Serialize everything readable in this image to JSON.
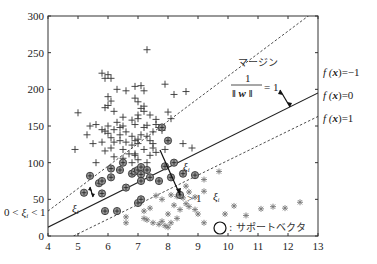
{
  "chart_data": {
    "type": "scatter",
    "title": "",
    "xlabel": "",
    "ylabel": "",
    "xlim": [
      4,
      13
    ],
    "ylim": [
      0,
      300
    ],
    "x_ticks": [
      4,
      5,
      6,
      7,
      8,
      9,
      10,
      11,
      12,
      13
    ],
    "y_ticks": [
      0,
      50,
      100,
      150,
      200,
      250,
      300
    ],
    "grid": false,
    "lines": [
      {
        "name": "f(x) = -1",
        "style": "dashed",
        "x": [
          4,
          13
        ],
        "y": [
          34,
          310
        ]
      },
      {
        "name": "f(x) = 0",
        "style": "solid",
        "x": [
          4,
          13
        ],
        "y": [
          12,
          195
        ]
      },
      {
        "name": "f(x) = 1",
        "style": "dashed",
        "x": [
          4.85,
          13
        ],
        "y": [
          0,
          163
        ]
      }
    ],
    "series": [
      {
        "name": "class +1 (plus markers)",
        "marker": "plus",
        "points": [
          [
            5.0,
            168
          ],
          [
            5.8,
            222
          ],
          [
            6.0,
            220
          ],
          [
            6.1,
            215
          ],
          [
            5.9,
            215
          ],
          [
            7.3,
            254
          ],
          [
            6.3,
            200
          ],
          [
            6.6,
            198
          ],
          [
            6.9,
            204
          ],
          [
            7.1,
            205
          ],
          [
            7.2,
            198
          ],
          [
            7.9,
            207
          ],
          [
            8.2,
            193
          ],
          [
            8.6,
            197
          ],
          [
            6.0,
            190
          ],
          [
            6.1,
            184
          ],
          [
            6.0,
            178
          ],
          [
            6.2,
            170
          ],
          [
            5.9,
            175
          ],
          [
            6.9,
            188
          ],
          [
            7.0,
            183
          ],
          [
            7.2,
            177
          ],
          [
            7.1,
            174
          ],
          [
            7.2,
            170
          ],
          [
            7.4,
            165
          ],
          [
            7.6,
            159
          ],
          [
            7.0,
            160
          ],
          [
            7.0,
            165
          ],
          [
            8.0,
            169
          ],
          [
            8.1,
            160
          ],
          [
            6.5,
            162
          ],
          [
            6.8,
            158
          ],
          [
            6.9,
            152
          ],
          [
            6.5,
            150
          ],
          [
            7.3,
            151
          ],
          [
            7.6,
            152
          ],
          [
            7.7,
            148
          ],
          [
            7.8,
            144
          ],
          [
            7.5,
            142
          ],
          [
            7.2,
            148
          ],
          [
            5.4,
            150
          ],
          [
            5.6,
            152
          ],
          [
            5.8,
            145
          ],
          [
            6.0,
            150
          ],
          [
            6.0,
            140
          ],
          [
            5.9,
            143
          ],
          [
            6.3,
            155
          ],
          [
            6.4,
            148
          ],
          [
            6.2,
            145
          ],
          [
            6.4,
            138
          ],
          [
            6.6,
            142
          ],
          [
            6.8,
            136
          ],
          [
            6.9,
            130
          ],
          [
            7.0,
            132
          ],
          [
            7.1,
            138
          ],
          [
            7.3,
            136
          ],
          [
            7.4,
            130
          ],
          [
            7.5,
            126
          ],
          [
            7.0,
            126
          ],
          [
            6.8,
            124
          ],
          [
            6.6,
            128
          ],
          [
            6.4,
            130
          ],
          [
            6.2,
            128
          ],
          [
            6.1,
            134
          ],
          [
            5.8,
            128
          ],
          [
            5.5,
            126
          ],
          [
            5.3,
            138
          ],
          [
            4.9,
            118
          ],
          [
            5.9,
            116
          ],
          [
            6.1,
            120
          ],
          [
            6.5,
            118
          ],
          [
            6.7,
            112
          ],
          [
            6.9,
            110
          ],
          [
            7.2,
            118
          ],
          [
            7.5,
            120
          ],
          [
            7.6,
            114
          ],
          [
            7.9,
            118
          ],
          [
            8.5,
            126
          ],
          [
            8.8,
            120
          ],
          [
            5.6,
            100
          ],
          [
            6.2,
            108
          ],
          [
            6.5,
            106
          ],
          [
            7.0,
            104
          ],
          [
            7.3,
            100
          ],
          [
            7.4,
            110
          ],
          [
            6.8,
            100
          ],
          [
            6.9,
            112
          ]
        ]
      },
      {
        "name": "class -1 (asterisk markers)",
        "marker": "asterisk",
        "points": [
          [
            9.7,
            88
          ],
          [
            9.2,
            77
          ],
          [
            9.2,
            61
          ],
          [
            10.2,
            41
          ],
          [
            10.6,
            28
          ],
          [
            11.1,
            37
          ],
          [
            11.5,
            40
          ],
          [
            11.9,
            38
          ],
          [
            12.4,
            46
          ],
          [
            9.9,
            30
          ],
          [
            9.2,
            18
          ],
          [
            8.6,
            68
          ],
          [
            8.7,
            60
          ],
          [
            8.3,
            54
          ],
          [
            8.5,
            52
          ],
          [
            8.9,
            53
          ],
          [
            8.1,
            56
          ],
          [
            7.8,
            50
          ],
          [
            7.6,
            55
          ],
          [
            7.1,
            46
          ],
          [
            7.4,
            38
          ],
          [
            7.2,
            34
          ],
          [
            7.3,
            22
          ],
          [
            7.5,
            18
          ],
          [
            7.7,
            16
          ],
          [
            7.9,
            14
          ],
          [
            8.0,
            12
          ],
          [
            7.8,
            20
          ],
          [
            7.2,
            24
          ],
          [
            6.6,
            26
          ],
          [
            6.6,
            18
          ],
          [
            8.0,
            30
          ],
          [
            8.3,
            24
          ],
          [
            8.1,
            18
          ],
          [
            8.4,
            36
          ],
          [
            8.2,
            42
          ],
          [
            8.6,
            44
          ],
          [
            8.7,
            40
          ],
          [
            8.9,
            36
          ],
          [
            9.0,
            30
          ]
        ]
      },
      {
        "name": "support vectors (circled)",
        "marker": "circle",
        "points": [
          [
            5.2,
            59
          ],
          [
            5.7,
            72
          ],
          [
            5.8,
            58
          ],
          [
            5.4,
            82
          ],
          [
            5.8,
            75
          ],
          [
            6.1,
            80
          ],
          [
            6.1,
            92
          ],
          [
            6.4,
            90
          ],
          [
            6.5,
            100
          ],
          [
            6.6,
            66
          ],
          [
            6.8,
            85
          ],
          [
            6.9,
            88
          ],
          [
            7.0,
            90
          ],
          [
            7.1,
            94
          ],
          [
            7.1,
            84
          ],
          [
            7.1,
            75
          ],
          [
            7.3,
            90
          ],
          [
            7.4,
            80
          ],
          [
            7.7,
            75
          ],
          [
            7.9,
            95
          ],
          [
            8.2,
            100
          ],
          [
            8.1,
            80
          ],
          [
            7.8,
            148
          ],
          [
            8.0,
            130
          ],
          [
            8.5,
            85
          ],
          [
            8.4,
            56
          ],
          [
            5.9,
            34
          ],
          [
            6.3,
            34
          ],
          [
            7.0,
            45
          ],
          [
            7.1,
            50
          ],
          [
            8.9,
            83
          ]
        ]
      }
    ],
    "annotations": [
      {
        "text": "マージン",
        "x": 11.0,
        "y": 205
      },
      {
        "text": "1 / ||w|| = 1",
        "x": 11.0,
        "y": 175
      },
      {
        "text": "f(x) = -1",
        "position": "right",
        "y": 175
      },
      {
        "text": "f(x) = 0",
        "position": "right",
        "y": 147
      },
      {
        "text": "f(x) = 1",
        "position": "right",
        "y": 113
      },
      {
        "text": "ξ_i",
        "x": 8.5,
        "y": 95
      },
      {
        "text": "ξ_i",
        "x": 5.0,
        "y": 40
      },
      {
        "text": "0 < ξ_i < 1",
        "position": "left",
        "y": 45
      },
      {
        "text": "ξ_i",
        "x": 9.0,
        "y": 48
      },
      {
        "text": "ξ_i > 1 arrow",
        "x": 8.8,
        "y": 60
      },
      {
        "text": "○ : サポートベクタ",
        "x": 9.7,
        "y": 15
      }
    ]
  },
  "labels": {
    "margin": "マージン",
    "frac_num": "1",
    "frac_den": "‖ w ‖",
    "frac_eq": "= 1",
    "f_minus1_pre": "f (",
    "f_var": "x",
    "f_minus1_post": ")=−1",
    "f_zero_post": ")=0",
    "f_one_post": ")=1",
    "xi": "ξ",
    "sub_i": "i",
    "zero_lt": "0 <",
    "lt_one": "< 1",
    "gt_one": "> 1",
    "legend_sv": ": サポートベクタ"
  }
}
